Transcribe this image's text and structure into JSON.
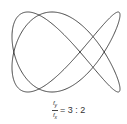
{
  "figure": {
    "type": "lissajous",
    "freq_y": 3,
    "freq_x": 2,
    "stroke_color": "#444444",
    "bounds": {
      "x_min": 12,
      "x_max": 120,
      "y_min": 12,
      "y_max": 92
    }
  },
  "label": {
    "numerator": "f",
    "numerator_sub": "y",
    "denominator": "f",
    "denominator_sub": "x",
    "ratio_text": "= 3 : 2"
  }
}
